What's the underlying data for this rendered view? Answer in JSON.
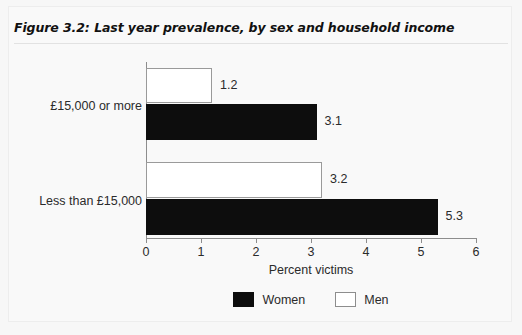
{
  "figure": {
    "number": "Figure 3.2:",
    "title": "Last year prevalence, by sex and household income"
  },
  "chart_data": {
    "type": "bar",
    "orientation": "horizontal",
    "title": "Last year prevalence, by sex and household income",
    "categories": [
      "Less than £15,000",
      "£15,000 or more"
    ],
    "series": [
      {
        "name": "Women",
        "color": "#0d0d0d",
        "values": [
          5.3,
          3.1
        ]
      },
      {
        "name": "Men",
        "color": "#ffffff",
        "values": [
          3.2,
          1.2
        ]
      }
    ],
    "xlabel": "Percent victims",
    "ylabel": "",
    "xlim": [
      0,
      6
    ],
    "xticks": [
      "0",
      "1",
      "2",
      "3",
      "4",
      "5",
      "6"
    ],
    "grid": false,
    "legend_position": "bottom",
    "data_labels": [
      "1.2",
      "3.1",
      "3.2",
      "5.3"
    ]
  },
  "legend": {
    "items": [
      {
        "label": "Women",
        "swatch": "filled-black-swatch"
      },
      {
        "label": "Men",
        "swatch": "outlined-white-swatch"
      }
    ]
  }
}
